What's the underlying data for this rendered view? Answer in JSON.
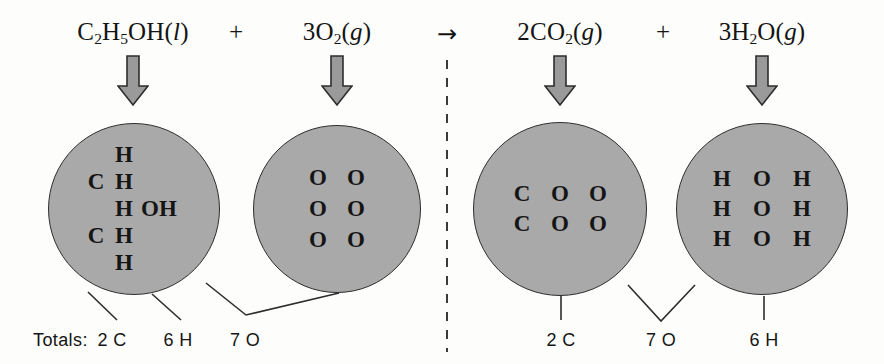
{
  "figure": {
    "type": "chemical-equation-diagram",
    "reaction_name": "Combustion of ethanol atom inventory",
    "background_color": "#fdfdfb",
    "circle_fill": "#a9a9a9",
    "circle_stroke": "#2e2e2e",
    "arrow_fill": "#9a9a9a",
    "text_color": "#151515"
  },
  "equation": {
    "reactants": [
      {
        "id": "ethanol",
        "coefficient": "",
        "formula_parts": [
          {
            "text": "C",
            "sub": false,
            "italic": false
          },
          {
            "text": "2",
            "sub": true,
            "italic": false
          },
          {
            "text": "H",
            "sub": false,
            "italic": false
          },
          {
            "text": "5",
            "sub": true,
            "italic": false
          },
          {
            "text": "OH(",
            "sub": false,
            "italic": false
          },
          {
            "text": "l",
            "sub": false,
            "italic": true
          },
          {
            "text": ")",
            "sub": false,
            "italic": false
          }
        ],
        "plain": "C2H5OH(l)",
        "x": 133
      },
      {
        "id": "oxygen",
        "coefficient": "3",
        "formula_parts": [
          {
            "text": "3O",
            "sub": false,
            "italic": false
          },
          {
            "text": "2",
            "sub": true,
            "italic": false
          },
          {
            "text": "(",
            "sub": false,
            "italic": false
          },
          {
            "text": "g",
            "sub": false,
            "italic": true
          },
          {
            "text": ")",
            "sub": false,
            "italic": false
          }
        ],
        "plain": "3O2(g)",
        "x": 337
      }
    ],
    "products": [
      {
        "id": "carbon-dioxide",
        "coefficient": "2",
        "formula_parts": [
          {
            "text": "2CO",
            "sub": false,
            "italic": false
          },
          {
            "text": "2",
            "sub": true,
            "italic": false
          },
          {
            "text": "(",
            "sub": false,
            "italic": false
          },
          {
            "text": "g",
            "sub": false,
            "italic": true
          },
          {
            "text": ")",
            "sub": false,
            "italic": false
          }
        ],
        "plain": "2CO2(g)",
        "x": 560
      },
      {
        "id": "water",
        "coefficient": "3",
        "formula_parts": [
          {
            "text": "3H",
            "sub": false,
            "italic": false
          },
          {
            "text": "2",
            "sub": true,
            "italic": false
          },
          {
            "text": "O(",
            "sub": false,
            "italic": false
          },
          {
            "text": "g",
            "sub": false,
            "italic": true
          },
          {
            "text": ")",
            "sub": false,
            "italic": false
          }
        ],
        "plain": "3H2O(g)",
        "x": 762
      }
    ],
    "plus_signs": [
      {
        "label": "+",
        "x": 236
      },
      {
        "label": "+",
        "x": 663
      }
    ],
    "yields_arrow": {
      "label": "→",
      "x": 447
    }
  },
  "circles": [
    {
      "id": "ethanol-circle",
      "cx": 134,
      "cy": 209,
      "r": 86,
      "layout": "grid-eth",
      "cells": [
        {
          "text": "",
          "blank": true
        },
        {
          "text": "H",
          "blank": false
        },
        {
          "text": "",
          "blank": true
        },
        {
          "text": "C",
          "blank": false
        },
        {
          "text": "H",
          "blank": false
        },
        {
          "text": "",
          "blank": true
        },
        {
          "text": "",
          "blank": true
        },
        {
          "text": "H",
          "blank": false
        },
        {
          "text": "OH",
          "blank": false
        },
        {
          "text": "C",
          "blank": false
        },
        {
          "text": "H",
          "blank": false
        },
        {
          "text": "",
          "blank": true
        },
        {
          "text": "",
          "blank": true
        },
        {
          "text": "H",
          "blank": false
        },
        {
          "text": "",
          "blank": true
        }
      ],
      "atom_counts": {
        "C": 2,
        "H": 6,
        "O": 1
      }
    },
    {
      "id": "oxygen-circle",
      "cx": 337,
      "cy": 209,
      "r": 84,
      "layout": "grid-o2",
      "cells": [
        {
          "text": "O",
          "blank": false
        },
        {
          "text": "O",
          "blank": false
        },
        {
          "text": "O",
          "blank": false
        },
        {
          "text": "O",
          "blank": false
        },
        {
          "text": "O",
          "blank": false
        },
        {
          "text": "O",
          "blank": false
        }
      ],
      "atom_counts": {
        "O": 6
      }
    },
    {
      "id": "carbon-dioxide-circle",
      "cx": 560,
      "cy": 209,
      "r": 87,
      "layout": "grid-co2",
      "cells": [
        {
          "text": "C",
          "blank": false
        },
        {
          "text": "O",
          "blank": false
        },
        {
          "text": "O",
          "blank": false
        },
        {
          "text": "C",
          "blank": false
        },
        {
          "text": "O",
          "blank": false
        },
        {
          "text": "O",
          "blank": false
        }
      ],
      "atom_counts": {
        "C": 2,
        "O": 4
      }
    },
    {
      "id": "water-circle",
      "cx": 762,
      "cy": 209,
      "r": 86,
      "layout": "grid-h2o",
      "cells": [
        {
          "text": "H",
          "blank": false
        },
        {
          "text": "O",
          "blank": false
        },
        {
          "text": "H",
          "blank": false
        },
        {
          "text": "H",
          "blank": false
        },
        {
          "text": "O",
          "blank": false
        },
        {
          "text": "H",
          "blank": false
        },
        {
          "text": "H",
          "blank": false
        },
        {
          "text": "O",
          "blank": false
        },
        {
          "text": "H",
          "blank": false
        }
      ],
      "atom_counts": {
        "H": 6,
        "O": 3
      }
    }
  ],
  "down_arrows": [
    {
      "id": "arrow-ethanol",
      "x": 133,
      "y": 55
    },
    {
      "id": "arrow-oxygen",
      "x": 337,
      "y": 55
    },
    {
      "id": "arrow-carbon-dioxide",
      "x": 560,
      "y": 55
    },
    {
      "id": "arrow-water",
      "x": 762,
      "y": 55
    }
  ],
  "totals": {
    "label": "Totals:",
    "label_x": 33,
    "label_y": 330,
    "reactant_counts": [
      {
        "id": "reactant-carbon",
        "count": "2",
        "symbol": "C",
        "text": "2 C",
        "x": 112
      },
      {
        "id": "reactant-hydrogen",
        "count": "6",
        "symbol": "H",
        "text": "6 H",
        "x": 178
      },
      {
        "id": "reactant-oxygen",
        "count": "7",
        "symbol": "O",
        "text": "7 O",
        "x": 245
      }
    ],
    "product_counts": [
      {
        "id": "product-carbon",
        "count": "2",
        "symbol": "C",
        "text": "2 C",
        "x": 561
      },
      {
        "id": "product-oxygen",
        "count": "7",
        "symbol": "O",
        "text": "7 O",
        "x": 661
      },
      {
        "id": "product-hydrogen",
        "count": "6",
        "symbol": "H",
        "text": "6 H",
        "x": 764
      }
    ]
  },
  "divider": {
    "id": "dashed-divider",
    "x": 447,
    "y_top": 60,
    "y_bottom": 352
  }
}
